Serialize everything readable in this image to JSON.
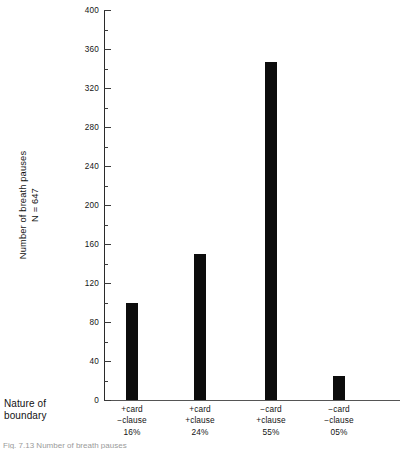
{
  "figure": {
    "background_color": "#ffffff",
    "bar_color": "#0c0c0c",
    "axis_color": "#2b2b2b"
  },
  "axis_titles": {
    "y_line1": "Number of breath pauses",
    "y_line2": "N = 647",
    "x_line1": "Nature of",
    "x_line2": "boundary"
  },
  "caption": {
    "text": "Fig. 7.13   Number of breath pauses"
  },
  "chart_data": {
    "type": "bar",
    "title": "",
    "xlabel": "Nature of boundary",
    "ylabel": "Number of breath pauses N = 647",
    "ylim": [
      0,
      400
    ],
    "ytick_major": [
      0,
      40,
      80,
      120,
      160,
      200,
      240,
      280,
      320,
      360,
      400
    ],
    "ytick_minor": [
      20,
      60,
      100,
      140,
      180,
      220,
      260,
      300,
      340,
      380
    ],
    "grid": false,
    "legend": false,
    "categories": [
      "+card\n−clause\n16%",
      "+card\n+clause\n24%",
      "−card\n+clause\n55%",
      "−card\n−clause\n05%"
    ],
    "category_parts": [
      {
        "line1": "+card",
        "line2": "−clause",
        "percent": "16%"
      },
      {
        "line1": "+card",
        "line2": "+clause",
        "percent": "24%"
      },
      {
        "line1": "−card",
        "line2": "+clause",
        "percent": "55%"
      },
      {
        "line1": "−card",
        "line2": "−clause",
        "percent": "05%"
      }
    ],
    "values": [
      100,
      150,
      347,
      25
    ],
    "total_n": 647
  },
  "ticks": [
    {
      "label": "400",
      "value": 400
    },
    {
      "label": "360",
      "value": 360
    },
    {
      "label": "320",
      "value": 320
    },
    {
      "label": "280",
      "value": 280
    },
    {
      "label": "240",
      "value": 240
    },
    {
      "label": "200",
      "value": 200
    },
    {
      "label": "160",
      "value": 160
    },
    {
      "label": "120",
      "value": 120
    },
    {
      "label": "80",
      "value": 80
    },
    {
      "label": "40",
      "value": 40
    },
    {
      "label": "0",
      "value": 0
    }
  ]
}
